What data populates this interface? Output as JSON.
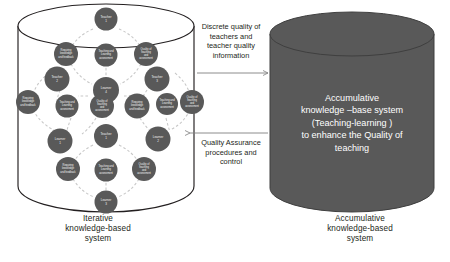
{
  "diagram": {
    "title_role": "two-cylinder knowledge system flow diagram",
    "left_system": {
      "caption_line1": "Iterative",
      "caption_line2": "knowledge-based",
      "caption_line3": "system",
      "shape": "open-cylinder-outline",
      "fill": "#ffffff",
      "stroke": "#231f20",
      "node_fill": "#595959",
      "node_text_color": "#f2f2f2",
      "connector_color": "#bfbfbf",
      "connector_style": "dashed-arc",
      "concept_labels": [
        "Requiring knowledge and feedback",
        "Teaching and Learning assessment",
        "Quality of teaching and assessment"
      ],
      "actor_labels": [
        "Teacher 1",
        "Learner 4",
        "Teacher 3",
        "Teacher 2",
        "Learner 1",
        "Teacher 1",
        "Learner 2",
        "Learner 3"
      ],
      "clusters": [
        {
          "id": "cluster-top",
          "head": {
            "line1": "Teacher",
            "line2": "1"
          },
          "concepts": [
            {
              "line1": "Requiring",
              "line2": "knowledge",
              "line3": "and feedback"
            },
            {
              "line1": "Teaching and",
              "line2": "Learning",
              "line3": "assessment"
            },
            {
              "line1": "Quality of",
              "line2": "teaching",
              "line3": "and",
              "line4": "assessment"
            }
          ],
          "tail": {
            "line1": "Learner",
            "line2": "4"
          }
        },
        {
          "id": "cluster-left",
          "head": {
            "line1": "Teacher",
            "line2": "2"
          },
          "concepts": [
            {
              "line1": "Requiring",
              "line2": "knowledge",
              "line3": "and feedback"
            },
            {
              "line1": "Teaching and",
              "line2": "Learning",
              "line3": "assessment"
            },
            {
              "line1": "Quality of",
              "line2": "teaching",
              "line3": "and",
              "line4": "assessment"
            }
          ],
          "tail": {
            "line1": "Learner",
            "line2": "1"
          }
        },
        {
          "id": "cluster-right",
          "head": {
            "line1": "Teacher",
            "line2": "3"
          },
          "concepts": [
            {
              "line1": "Requiring",
              "line2": "knowledge",
              "line3": "and feedback"
            },
            {
              "line1": "Teaching and",
              "line2": "Learning",
              "line3": "assessment"
            },
            {
              "line1": "Quality of",
              "line2": "teaching",
              "line3": "and",
              "line4": "assessment"
            }
          ],
          "tail": {
            "line1": "Learner",
            "line2": "2"
          }
        },
        {
          "id": "cluster-bottom",
          "head": {
            "line1": "Teacher",
            "line2": "1"
          },
          "concepts": [
            {
              "line1": "Requiring",
              "line2": "knowledge",
              "line3": "and feedback"
            },
            {
              "line1": "Teaching and",
              "line2": "Learning",
              "line3": "assessment"
            },
            {
              "line1": "Quality of",
              "line2": "teaching",
              "line3": "and",
              "line4": "assessment"
            }
          ],
          "tail": {
            "line1": "Learner",
            "line2": "3"
          }
        }
      ]
    },
    "right_system": {
      "caption_line1": "Accumulative",
      "caption_line2": "knowledge-based",
      "caption_line3": "system",
      "shape": "solid-cylinder",
      "fill": "#595959",
      "stroke": "#3f3f3f",
      "body_line1": "Accumulative",
      "body_line2": "knowledge –base system",
      "body_line3": "(Teaching-learning )",
      "body_line4": "to enhance the Quality of",
      "body_line5": "teaching",
      "body_text_color": "#ffffff"
    },
    "flows": [
      {
        "id": "flow-forward",
        "direction": "left-to-right",
        "label_line1": "Discrete quality of",
        "label_line2": "teachers and",
        "label_line3": "teacher quality",
        "label_line4": "information"
      },
      {
        "id": "flow-feedback",
        "direction": "right-to-left",
        "label_line1": "Quality Assurance",
        "label_line2": "procedures and",
        "label_line3": "control"
      }
    ]
  }
}
